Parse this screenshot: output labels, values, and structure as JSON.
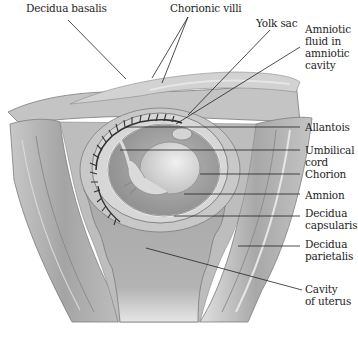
{
  "labels": {
    "decidua_basalis": "Decidua basalis",
    "chorionic_villi": "Chorionic villi",
    "yolk_sac": "Yolk sac",
    "amniotic_fluid": "Amniotic\nfluid in\namniotic\ncavity",
    "allantois": "Allantois",
    "umbilical_cord": "Umbilical\ncord",
    "chorion": "Chorion",
    "amnion": "Amnion",
    "decidua_capsularis": "Decidua\ncapsularis",
    "decidua_parietalis": "Decidua\nparietalis",
    "cavity_of_uterus": "Cavity\nof uterus"
  },
  "colors": {
    "background": "#ffffff",
    "uterine_wall": "#b8b8b8",
    "decidua": "#c9c9c9",
    "cavity": "#a9a9a9",
    "chorion_ring": "#d6d6d6",
    "amniotic_fluid": "#9c9c9c",
    "embryo": "#e2e2e2",
    "villi": "#3a3a3a",
    "leader_line": "#222222"
  }
}
